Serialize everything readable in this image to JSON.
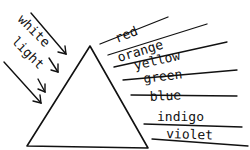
{
  "diagram": {
    "input_label": [
      "white",
      "light"
    ],
    "spectrum": [
      "red",
      "orange",
      "yellow",
      "green",
      "blue",
      "indigo",
      "violet"
    ],
    "ink_color": "#111111",
    "background": "#ffffff"
  }
}
